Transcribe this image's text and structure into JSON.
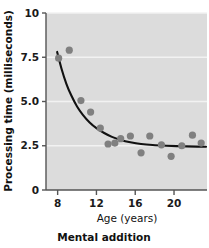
{
  "figure": {
    "caption": "Mental addition",
    "background": "#ffffff"
  },
  "chart_data": {
    "type": "scatter",
    "title": "",
    "subtitle": "",
    "caption": "Mental addition",
    "xlabel": "Age (years)",
    "ylabel": "Processing time (milliseconds)",
    "xlim": [
      6.8,
      23.4
    ],
    "ylim": [
      0,
      10
    ],
    "xticks": [
      8,
      12,
      16,
      20
    ],
    "xtick_labels": [
      "8",
      "12",
      "16",
      "20"
    ],
    "yticks": [
      0,
      2.5,
      5.0,
      7.5,
      10
    ],
    "ytick_labels": [
      "0",
      "2.5",
      "5.0",
      "7.5",
      "10"
    ],
    "grid": "horizontal-white-gridlines",
    "legend": "none",
    "plot_background": "#dcdcdc",
    "point_color": "#808080",
    "line_color": "#111111",
    "axis_color": "#555555",
    "gridline_color": "#f2f2f2",
    "point_radius_px": 3.6,
    "series": [
      {
        "name": "Observed processing time",
        "type": "scatter",
        "points": [
          {
            "x": 8.1,
            "y": 7.45
          },
          {
            "x": 9.2,
            "y": 7.9
          },
          {
            "x": 10.4,
            "y": 5.05
          },
          {
            "x": 11.4,
            "y": 4.4
          },
          {
            "x": 12.4,
            "y": 3.5
          },
          {
            "x": 13.2,
            "y": 2.6
          },
          {
            "x": 13.9,
            "y": 2.65
          },
          {
            "x": 14.5,
            "y": 2.9
          },
          {
            "x": 15.5,
            "y": 3.05
          },
          {
            "x": 16.6,
            "y": 2.1
          },
          {
            "x": 17.5,
            "y": 3.05
          },
          {
            "x": 18.7,
            "y": 2.55
          },
          {
            "x": 19.7,
            "y": 1.9
          },
          {
            "x": 20.8,
            "y": 2.5
          },
          {
            "x": 21.9,
            "y": 3.1
          },
          {
            "x": 22.8,
            "y": 2.65
          }
        ]
      },
      {
        "name": "Fitted decay curve",
        "type": "line",
        "points": [
          {
            "x": 7.95,
            "y": 7.8
          },
          {
            "x": 8.4,
            "y": 6.85
          },
          {
            "x": 8.9,
            "y": 6.0
          },
          {
            "x": 9.4,
            "y": 5.35
          },
          {
            "x": 10.0,
            "y": 4.72
          },
          {
            "x": 10.6,
            "y": 4.25
          },
          {
            "x": 11.3,
            "y": 3.82
          },
          {
            "x": 12.0,
            "y": 3.5
          },
          {
            "x": 12.8,
            "y": 3.22
          },
          {
            "x": 13.6,
            "y": 3.0
          },
          {
            "x": 14.5,
            "y": 2.83
          },
          {
            "x": 15.5,
            "y": 2.7
          },
          {
            "x": 16.6,
            "y": 2.6
          },
          {
            "x": 17.8,
            "y": 2.54
          },
          {
            "x": 19.2,
            "y": 2.5
          },
          {
            "x": 20.8,
            "y": 2.47
          },
          {
            "x": 22.4,
            "y": 2.45
          },
          {
            "x": 23.3,
            "y": 2.44
          }
        ]
      }
    ]
  }
}
